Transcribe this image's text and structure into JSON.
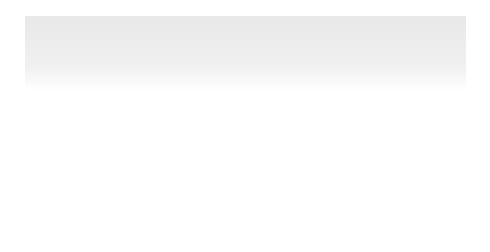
{
  "figure": {
    "border_color": "#6e6e6e",
    "gradient_top": "#e6e6e6",
    "gradient_bottom": "#ffffff",
    "arrow_color": "#111111",
    "finger_fill": "#e2e2e2",
    "nail_fill": "#fbfbfb",
    "outline_color": "#555555"
  },
  "gestures": [
    {
      "id": "rotate",
      "label": "Two-finger rotate",
      "arrow": "circular-clockwise-arrow"
    },
    {
      "id": "scroll-vertical",
      "label": "Two-finger vertical scroll",
      "arrow": "vertical-double-arrow"
    },
    {
      "id": "scroll-horizontal",
      "label": "Two-finger horizontal scroll",
      "arrow": "horizontal-double-arrow"
    }
  ]
}
